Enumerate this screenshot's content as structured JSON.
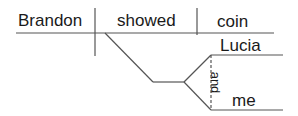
{
  "diagram": {
    "type": "sentence-diagram",
    "subject": "Brandon",
    "verb": "showed",
    "direct_object": "coin",
    "indirect_objects": [
      "Lucia",
      "me"
    ],
    "conjunction": "and",
    "line_color": "#555555",
    "text_color": "#1a1a1a"
  }
}
